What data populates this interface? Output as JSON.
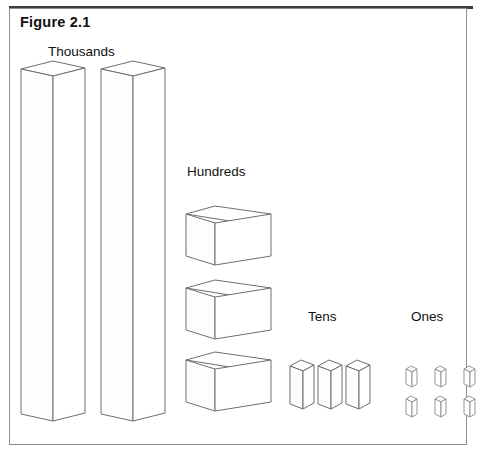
{
  "figure": {
    "title": "Figure 2.1",
    "caption_bold": true,
    "frame_color": "#8d8d8d",
    "rule_color": "#3d3d3d",
    "stroke_color": "#6e6e6e",
    "fill_color": "#ffffff"
  },
  "labels": {
    "thousands": "Thousands",
    "hundreds": "Hundreds",
    "tens": "Tens",
    "ones": "Ones"
  },
  "place_values": [
    {
      "name": "thousands",
      "label": "Thousands",
      "block_shape": "tall-cube-column",
      "count": 2,
      "unit_value": 1000,
      "total": 2000
    },
    {
      "name": "hundreds",
      "label": "Hundreds",
      "block_shape": "flat-slab",
      "count": 3,
      "unit_value": 100,
      "total": 300
    },
    {
      "name": "tens",
      "label": "Tens",
      "block_shape": "rod",
      "count": 3,
      "unit_value": 10,
      "total": 30
    },
    {
      "name": "ones",
      "label": "Ones",
      "block_shape": "small-unit-cube",
      "count": 6,
      "unit_value": 1,
      "total": 6
    }
  ],
  "represented_number": "2336"
}
